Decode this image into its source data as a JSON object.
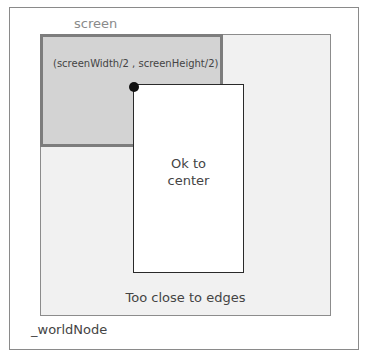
{
  "labels": {
    "screen": "screen",
    "center_point": "(screenWidth/2 , screenHeight/2)",
    "ok_line1": "Ok to",
    "ok_line2": "center",
    "too_close": "Too close to edges",
    "world_node": "_worldNode"
  },
  "colors": {
    "screen_fill": "#d3d3d3",
    "screen_border": "#7d7d7d",
    "world_fill": "#f1f1f1",
    "center_box_fill": "#ffffff",
    "dot": "#111111"
  }
}
